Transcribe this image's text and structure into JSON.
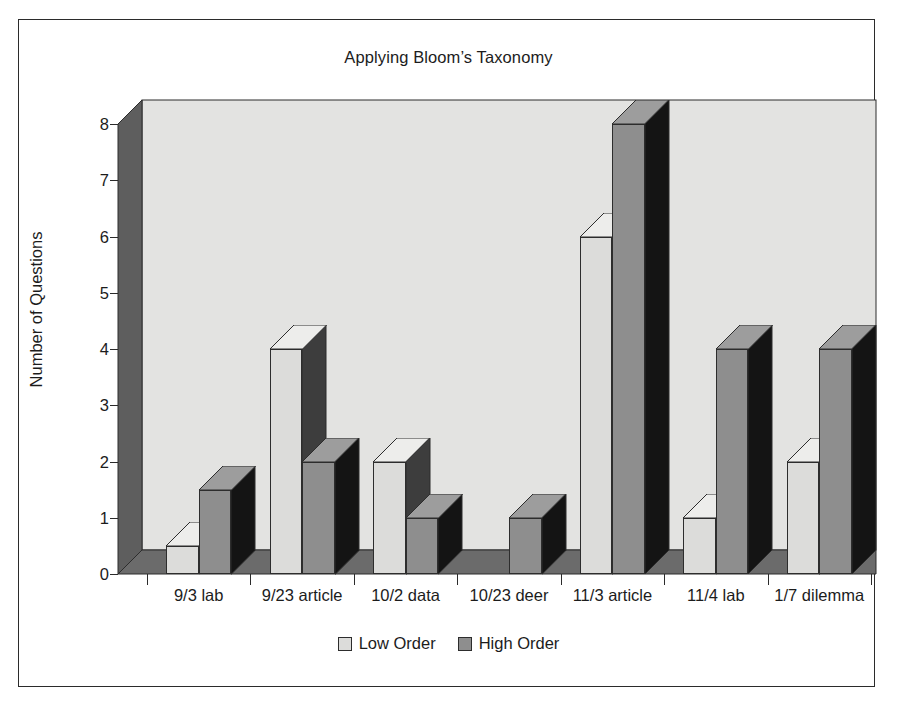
{
  "chart_data": {
    "type": "bar",
    "title": "Applying Bloom’s Taxonomy",
    "xlabel": "",
    "ylabel": "Number of Questions",
    "ylim": [
      0,
      8
    ],
    "yticks": [
      0,
      1,
      2,
      3,
      4,
      5,
      6,
      7,
      8
    ],
    "grid": false,
    "legend_position": "bottom",
    "style": "3d-column",
    "categories": [
      "9/3 lab",
      "9/23 article",
      "10/2 data",
      "10/23 deer",
      "11/3 article",
      "11/4 lab",
      "1/7 dilemma"
    ],
    "series": [
      {
        "name": "Low Order",
        "color": "#dcdcda",
        "values": [
          0.5,
          4,
          2,
          0,
          6,
          1,
          2
        ]
      },
      {
        "name": "High Order",
        "color": "#8e8e8e",
        "values": [
          1.5,
          2,
          1,
          1,
          8,
          4,
          4
        ]
      }
    ]
  },
  "legend": {
    "items": [
      {
        "label": "Low Order",
        "color": "#dcdcda"
      },
      {
        "label": "High Order",
        "color": "#8e8e8e"
      }
    ]
  },
  "colors": {
    "plot_background": "#e3e3e1",
    "wall_shadow": "#5e5e5e",
    "floor_shadow": "#6b6b6b",
    "outline": "#2d2d2d",
    "page_background": "#ffffff"
  }
}
